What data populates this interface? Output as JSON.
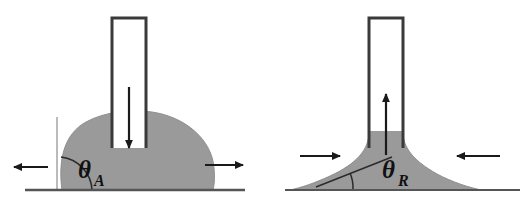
{
  "figure": {
    "width": 531,
    "height": 217,
    "background_color": "#ffffff"
  },
  "colors": {
    "liquid_fill": "#9a9a9a",
    "outline": "#3a3a3a",
    "baseline": "#555555",
    "arrow": "#1a1a1a",
    "guide_line": "#777777",
    "label_text": "#111111",
    "tube_interior": "#ffffff"
  },
  "panels": [
    {
      "id": "advancing",
      "name": "advancing-contact-angle-panel",
      "angle_label": "θ",
      "angle_subscript": "A",
      "angle_label_full": "θA",
      "description": "Liquid pushed out of capillary tube forms a bulging drop; contact line advances outward",
      "tube": {
        "name": "capillary-tube-left",
        "open_end": "bottom",
        "x": 112,
        "y": 18,
        "width": 34,
        "height": 130
      },
      "flow_arrow": {
        "name": "flow-arrow-down",
        "direction": "down",
        "meaning": "liquid dispensed into drop"
      },
      "contact_line_arrows": [
        {
          "name": "contact-line-arrow-left",
          "direction": "left",
          "meaning": "contact line advances outward"
        },
        {
          "name": "contact-line-arrow-right",
          "direction": "right",
          "meaning": "contact line advances outward"
        }
      ],
      "baseline": {
        "name": "substrate-baseline-left",
        "y": 190,
        "x1": 25,
        "x2": 245
      },
      "guide_line": {
        "name": "vertical-guide-line",
        "x": 57,
        "y1": 118,
        "y2": 190
      },
      "angle_arc": {
        "name": "angle-arc-advancing",
        "radius": 32
      }
    },
    {
      "id": "receding",
      "name": "receding-contact-angle-panel",
      "angle_label": "θ",
      "angle_subscript": "R",
      "angle_label_full": "θR",
      "description": "Liquid withdrawn into capillary tube forms a concave neck; contact line recedes inward",
      "tube": {
        "name": "capillary-tube-right",
        "open_end": "bottom",
        "x": 369,
        "y": 18,
        "width": 34,
        "height": 130
      },
      "flow_arrow": {
        "name": "flow-arrow-up",
        "direction": "up",
        "meaning": "liquid withdrawn from drop"
      },
      "contact_line_arrows": [
        {
          "name": "contact-line-arrow-left",
          "direction": "right",
          "meaning": "contact line recedes inward"
        },
        {
          "name": "contact-line-arrow-right",
          "direction": "left",
          "meaning": "contact line recedes inward"
        }
      ],
      "baseline": {
        "name": "substrate-baseline-right",
        "y": 190,
        "x1": 285,
        "x2": 520
      },
      "guide_line": {
        "name": "tangent-guide-line",
        "x1": 318,
        "y1": 186,
        "x2": 390,
        "y2": 158
      },
      "angle_arc": {
        "name": "angle-arc-receding",
        "radius": 36
      }
    }
  ]
}
